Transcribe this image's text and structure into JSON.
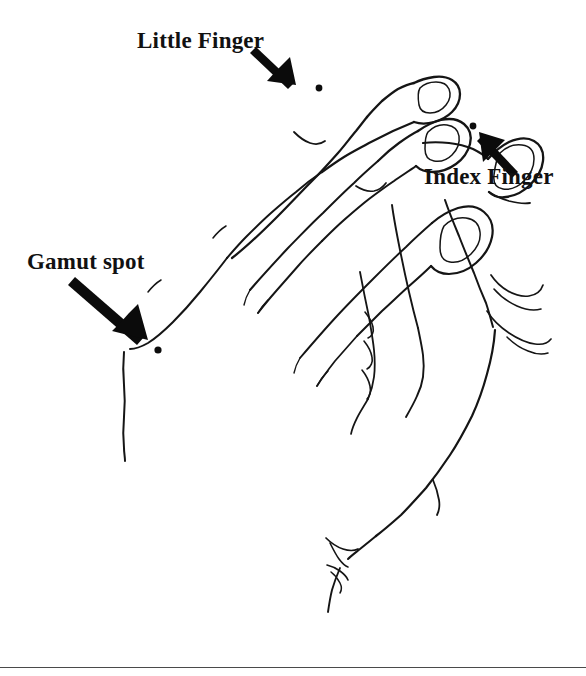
{
  "figure": {
    "name": "hand-anatomy-diagram",
    "width": 586,
    "height": 676,
    "background_color": "#ffffff",
    "ink_color": "#151515"
  },
  "labels": {
    "little_finger": "Little Finger",
    "index_finger": "Index Finger",
    "gamut_spot": "Gamut spot"
  },
  "annotations": [
    {
      "id": "little-finger",
      "label": "Little Finger",
      "label_position": {
        "x": 137,
        "y": 29
      },
      "arrow": {
        "from": {
          "x": 258,
          "y": 49
        },
        "to": {
          "x": 293,
          "y": 82
        }
      },
      "spot": {
        "x": 319,
        "y": 88,
        "radius": 3.4
      }
    },
    {
      "id": "index-finger",
      "label": "Index Finger",
      "label_position": {
        "x": 424,
        "y": 165
      },
      "arrow": {
        "from": {
          "x": 516,
          "y": 170
        },
        "to": {
          "x": 481,
          "y": 136
        }
      },
      "spot": {
        "x": 473,
        "y": 126,
        "radius": 3.4
      }
    },
    {
      "id": "gamut-spot",
      "label": "Gamut spot",
      "label_position": {
        "x": 27,
        "y": 250
      },
      "arrow": {
        "from": {
          "x": 77,
          "y": 279
        },
        "to": {
          "x": 143,
          "y": 336
        }
      },
      "spot": {
        "x": 158,
        "y": 350,
        "radius": 3.6
      }
    }
  ],
  "footer_rule": {
    "y": 667,
    "x_start": 0,
    "x_end": 586,
    "color": "#4a4a4a"
  }
}
